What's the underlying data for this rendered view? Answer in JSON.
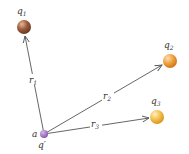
{
  "diagram": {
    "charges": [
      {
        "id": "q1",
        "label": "q",
        "sub": "1",
        "cx": 24,
        "cy": 27,
        "r": 7,
        "color": "#9a5a3a",
        "highlight": "#d9a884"
      },
      {
        "id": "q2",
        "label": "q",
        "sub": "2",
        "cx": 170,
        "cy": 61,
        "r": 7,
        "color": "#e8902a",
        "highlight": "#fbd49a"
      },
      {
        "id": "q3",
        "label": "q",
        "sub": "3",
        "cx": 157,
        "cy": 117,
        "r": 7,
        "color": "#edb43a",
        "highlight": "#fde6a8"
      }
    ],
    "test_charge": {
      "label": "q′",
      "point_label": "a",
      "cx": 44,
      "cy": 134,
      "r": 4,
      "color": "#9d6fc0"
    },
    "vectors": [
      {
        "id": "r1",
        "label": "r",
        "sub": "1"
      },
      {
        "id": "r2",
        "label": "r",
        "sub": "2"
      },
      {
        "id": "r3",
        "label": "r",
        "sub": "3"
      }
    ],
    "line_color": "#555555"
  }
}
